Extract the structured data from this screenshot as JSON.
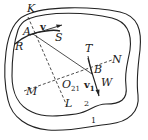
{
  "diagram": {
    "type": "kinematics-figure",
    "regions": [
      {
        "id": "outer-curve",
        "label": "1"
      },
      {
        "id": "inner-curve",
        "label": "2"
      }
    ],
    "points": {
      "K": "K",
      "A": "A",
      "R": "R",
      "S": "S",
      "T": "T",
      "N": "N",
      "B": "B",
      "W": "W",
      "M": "M",
      "L": "L",
      "O21_main": "O",
      "O21_sub": "21"
    },
    "vectors": {
      "v": "v",
      "v1_main": "v",
      "v1_sub": "1"
    },
    "region_labels": {
      "outer": "1",
      "inner": "2"
    },
    "colors": {
      "stroke": "#222222",
      "background": "#ffffff"
    }
  }
}
